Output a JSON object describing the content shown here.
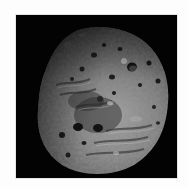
{
  "image": {
    "subject": "asteroid",
    "description": "Grayscale image of a heavily cratered, irregularly shaped asteroid against black space",
    "background_color": "#030303",
    "border_color": "#fdfdfd",
    "colors": {
      "surface_light": "#b4b4b4",
      "surface_mid": "#7a7a7a",
      "surface_dark": "#3a3a3a",
      "shadow": "#101010"
    }
  }
}
